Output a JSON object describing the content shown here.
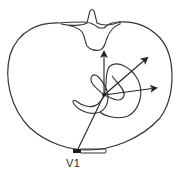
{
  "diagram": {
    "labels": {
      "electrode": "V1"
    },
    "colors": {
      "stroke": "#333333",
      "background": "#ffffff",
      "electrode_fill": "#1a1a1a"
    },
    "elements": [
      {
        "name": "thorax-outline",
        "type": "closed-contour"
      },
      {
        "name": "vertebra",
        "type": "shape",
        "position": "top-center"
      },
      {
        "name": "electrode-v1",
        "type": "marker",
        "position": "bottom-center-left"
      },
      {
        "name": "lead-axis-line",
        "type": "line",
        "from": "electrode-v1",
        "to": "vector-origin"
      },
      {
        "name": "vector-loop-small",
        "type": "loop"
      },
      {
        "name": "vector-loop-large",
        "type": "loop"
      },
      {
        "name": "vector-arrow-up",
        "type": "arrow",
        "direction": "superior/posterior"
      },
      {
        "name": "vector-arrow-diagonal",
        "type": "arrow",
        "direction": "up-right"
      },
      {
        "name": "vector-arrow-right",
        "type": "arrow",
        "direction": "right"
      }
    ]
  }
}
